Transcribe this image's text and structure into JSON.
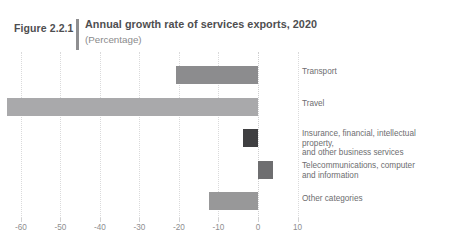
{
  "header": {
    "figure_number": "Figure 2.2.1",
    "title": "Annual growth rate of services exports, 2020",
    "subtitle": "(Percentage)"
  },
  "colors": {
    "bar_default": "#8c8c8e",
    "bar_dark": "#4a4a4c",
    "bar_light": "#a9a9ab",
    "grid": "#dadadb",
    "axis_text": "#8e8e90",
    "label_text": "#6d6d6f",
    "title_text": "#4e4e50",
    "subtitle_text": "#8a8a8c",
    "rule": "#8e8e90"
  },
  "chart_data": {
    "type": "bar",
    "orientation": "horizontal",
    "title": "Annual growth rate of services exports, 2020",
    "subtitle": "(Percentage)",
    "xlabel": "",
    "ylabel": "",
    "xlim": [
      -65,
      12
    ],
    "xticks": [
      -60,
      -50,
      -40,
      -30,
      -20,
      -10,
      0,
      10
    ],
    "xticklabels": [
      "-60",
      "-50",
      "-40",
      "-30",
      "-20",
      "-10",
      "0",
      "10"
    ],
    "grid": true,
    "legend": false,
    "categories": [
      "Transport",
      "Travel",
      "Insurance, financial, intellectual property, and other business services",
      "Telecommunications, computer and information",
      "Other categories"
    ],
    "values": [
      -20.8,
      -63.4,
      -3.8,
      3.8,
      -12.4
    ],
    "bars": [
      {
        "label": "Transport",
        "label_lines": [
          "Transport"
        ],
        "value": -20.8,
        "color": "#8c8c8e"
      },
      {
        "label": "Travel",
        "label_lines": [
          "Travel"
        ],
        "value": -63.4,
        "color": "#a9a9ab"
      },
      {
        "label": "Insurance, financial, intellectual property, and other business services",
        "label_lines": [
          "Insurance, financial, intellectual property,",
          "and other business services"
        ],
        "value": -3.8,
        "color": "#3f3f41"
      },
      {
        "label": "Telecommunications, computer and information",
        "label_lines": [
          "Telecommunications, computer",
          "and information"
        ],
        "value": 3.8,
        "color": "#6e6e70"
      },
      {
        "label": "Other categories",
        "label_lines": [
          "Other categories"
        ],
        "value": -12.4,
        "color": "#989899"
      }
    ]
  }
}
